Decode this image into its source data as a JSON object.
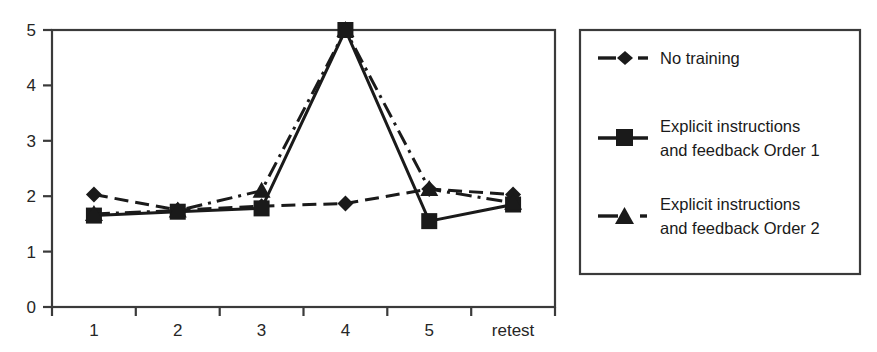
{
  "chart_data": {
    "type": "line",
    "title": "",
    "xlabel": "",
    "ylabel": "",
    "categories": [
      "1",
      "2",
      "3",
      "4",
      "5",
      "retest"
    ],
    "ylim": [
      0,
      5
    ],
    "yticks": [
      0,
      1,
      2,
      3,
      4,
      5
    ],
    "ytick_labels": [
      "0",
      "1",
      "2",
      "3",
      "4",
      "5"
    ],
    "grid": false,
    "legend_position": "right",
    "series": [
      {
        "name": "No training",
        "marker": "diamond",
        "linestyle": "dashed",
        "values": [
          2.03,
          1.75,
          1.82,
          1.87,
          2.13,
          2.03
        ]
      },
      {
        "name": "Explicit instructions and feedback Order 1",
        "marker": "square",
        "linestyle": "solid",
        "values": [
          1.65,
          1.72,
          1.78,
          5.0,
          1.55,
          1.85
        ]
      },
      {
        "name": "Explicit instructions and feedback Order 2",
        "marker": "triangle",
        "linestyle": "dashdot",
        "values": [
          1.68,
          1.74,
          2.1,
          5.0,
          2.13,
          1.88
        ]
      }
    ]
  },
  "axes": {
    "y_tick_labels": [
      "5",
      "4",
      "3",
      "2",
      "1",
      "0"
    ],
    "x_tick_labels": [
      "1",
      "2",
      "3",
      "4",
      "5",
      "retest"
    ]
  },
  "legend": {
    "items": [
      {
        "label": "No training",
        "line2": "",
        "marker": "diamond-marker",
        "style": "dashed"
      },
      {
        "label": "Explicit instructions",
        "line2": "and feedback Order 1",
        "marker": "square-marker",
        "style": "solid"
      },
      {
        "label": "Explicit instructions",
        "line2": "and feedback Order 2",
        "marker": "triangle-marker",
        "style": "dashdot"
      }
    ]
  },
  "colors": {
    "ink": "#1a1a1a",
    "axis": "#3a3a3a",
    "background": "#ffffff"
  }
}
